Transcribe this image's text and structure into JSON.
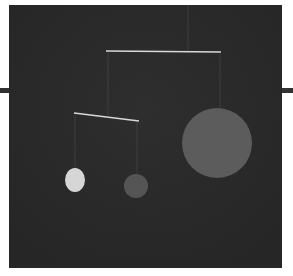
{
  "image": {
    "subject": "hanging mobile sculpture against dark background",
    "colors": {
      "page_background": "#ffffff",
      "panel_background": "#2b2b2b",
      "side_rule": "#333333",
      "wire": "#d8d8d8",
      "thread": "#6a6a6a",
      "large_disc": "#5c5c5c",
      "small_gray_disc": "#555555",
      "white_disc": "#d6d6d6"
    },
    "elements": [
      {
        "name": "upper-crossbar"
      },
      {
        "name": "lower-crossbar"
      },
      {
        "name": "large-disc"
      },
      {
        "name": "small-gray-disc"
      },
      {
        "name": "white-disc"
      }
    ]
  }
}
